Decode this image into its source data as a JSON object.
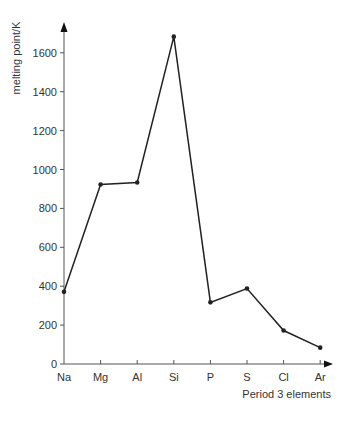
{
  "chart_data": {
    "type": "line",
    "title": "",
    "xlabel": "Period 3 elements",
    "ylabel": "melting point/K",
    "categories": [
      "Na",
      "Mg",
      "Al",
      "Si",
      "P",
      "S",
      "Cl",
      "Ar"
    ],
    "series": [
      {
        "name": "melting point",
        "values": [
          371,
          923,
          933,
          1683,
          317,
          388,
          172,
          84
        ]
      }
    ],
    "yticks": [
      0,
      200,
      400,
      600,
      800,
      1000,
      1200,
      1400,
      1600
    ],
    "ylim": [
      0,
      1800
    ],
    "grid": false,
    "legend": "none",
    "colors": {
      "line": "#222222",
      "axis": "#555555",
      "text": "#333333"
    }
  }
}
